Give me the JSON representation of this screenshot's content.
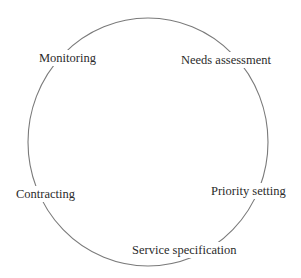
{
  "diagram": {
    "type": "cycle",
    "stages": [
      {
        "label": "Needs assessment",
        "x": 181,
        "y": 64
      },
      {
        "label": "Priority setting",
        "x": 211,
        "y": 195
      },
      {
        "label": "Service specification",
        "x": 132,
        "y": 254
      },
      {
        "label": "Contracting",
        "x": 16,
        "y": 198
      },
      {
        "label": "Monitoring",
        "x": 39,
        "y": 62
      }
    ],
    "ring": {
      "cx": 148,
      "cy": 142,
      "rx": 120,
      "ry": 124,
      "stroke": "#7a7a7a"
    }
  }
}
